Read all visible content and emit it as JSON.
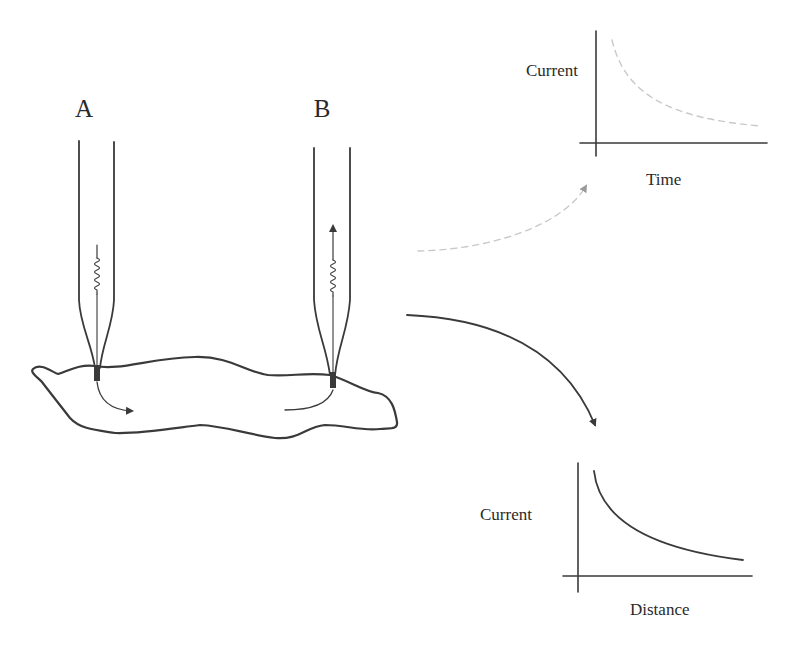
{
  "electrodes": [
    {
      "label": "A",
      "arrow_direction": "out-of-tip-into-surface"
    },
    {
      "label": "B",
      "arrow_direction": "into-tip-upward"
    }
  ],
  "top_graph": {
    "ylabel": "Current",
    "xlabel": "Time",
    "curve_style": "faint-dashed",
    "description": "decaying current vs time"
  },
  "bottom_graph": {
    "ylabel": "Current",
    "xlabel": "Distance",
    "curve_style": "solid",
    "description": "decaying current vs distance"
  },
  "connectors": [
    {
      "from": "diagram",
      "to": "top_graph",
      "style": "faint-dashed"
    },
    {
      "from": "diagram",
      "to": "bottom_graph",
      "style": "solid"
    }
  ],
  "colors": {
    "ink": "#3a3a3a",
    "faint": "#c9c9c9",
    "background": "#ffffff"
  }
}
